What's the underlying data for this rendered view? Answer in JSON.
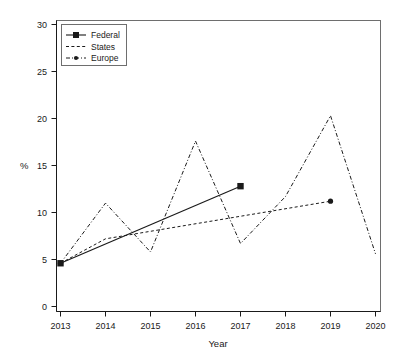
{
  "chart_data": {
    "type": "line",
    "title": "",
    "subtitle": "",
    "xlabel": "Year",
    "ylabel": "%",
    "x": [
      2013,
      2014,
      2015,
      2016,
      2017,
      2018,
      2019,
      2020
    ],
    "xlim": [
      2012.7,
      2020.3
    ],
    "ylim": [
      0,
      31.5
    ],
    "xticks": [
      "2013",
      "2014",
      "2015",
      "2016",
      "2017",
      "2018",
      "2019",
      "2020"
    ],
    "yticks": [
      "0",
      "5",
      "10",
      "15",
      "20",
      "25",
      "30"
    ],
    "ytick_values": [
      0,
      5,
      10,
      15,
      20,
      25,
      30
    ],
    "grid": false,
    "legend_position": "top-left",
    "series": [
      {
        "name": "Federal",
        "line_style": "solid",
        "marker": "square",
        "color": "#1a1a1a",
        "x": [
          2013,
          2017
        ],
        "values": [
          4.6,
          12.8
        ]
      },
      {
        "name": "States",
        "line_style": "dashed",
        "marker": "dot",
        "color": "#1a1a1a",
        "x": [
          2013,
          2014,
          2019
        ],
        "values": [
          4.6,
          7.2,
          11.2
        ]
      },
      {
        "name": "Europe",
        "line_style": "dashdot",
        "marker": "dot",
        "color": "#1a1a1a",
        "x": [
          2013,
          2014,
          2015,
          2016,
          2017,
          2018,
          2019,
          2020
        ],
        "values": [
          4.6,
          11.0,
          5.8,
          17.6,
          6.7,
          11.7,
          20.3,
          5.6
        ]
      }
    ]
  },
  "legend": {
    "entries": [
      {
        "label": "Federal"
      },
      {
        "label": "States"
      },
      {
        "label": "Europe"
      }
    ]
  }
}
